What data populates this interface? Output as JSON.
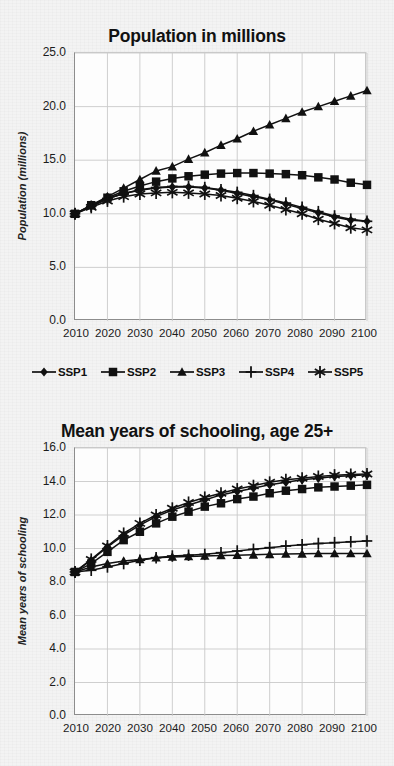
{
  "figure": {
    "background_color": "#f3f3f3",
    "series_color": "#111111",
    "grid_color": "#c9c9c9",
    "axis_color": "#8d8d8d"
  },
  "legend": {
    "position": "below-top-chart",
    "items": [
      {
        "label": "SSP1",
        "marker": "diamond-marker-icon"
      },
      {
        "label": "SSP2",
        "marker": "square-marker-icon"
      },
      {
        "label": "SSP3",
        "marker": "triangle-marker-icon"
      },
      {
        "label": "SSP4",
        "marker": "plus-marker-icon"
      },
      {
        "label": "SSP5",
        "marker": "asterisk-marker-icon"
      }
    ]
  },
  "chart_data": [
    {
      "id": "population",
      "type": "line",
      "title": "Population in millions",
      "xlabel": "",
      "ylabel": "Population (millions)",
      "x": [
        2010,
        2015,
        2020,
        2025,
        2030,
        2035,
        2040,
        2045,
        2050,
        2055,
        2060,
        2065,
        2070,
        2075,
        2080,
        2085,
        2090,
        2095,
        2100
      ],
      "xlim": [
        2010,
        2100
      ],
      "ylim": [
        0.0,
        25.0
      ],
      "yticks": [
        "0.0",
        "5.0",
        "10.0",
        "15.0",
        "20.0",
        "25.0"
      ],
      "ytick_values": [
        0.0,
        5.0,
        10.0,
        15.0,
        20.0,
        25.0
      ],
      "xticks": [
        "2010",
        "2020",
        "2030",
        "2040",
        "2050",
        "2060",
        "2070",
        "2080",
        "2090",
        "2100"
      ],
      "grid": true,
      "series": [
        {
          "name": "SSP1",
          "marker": "diamond-marker-icon",
          "values": [
            10.0,
            10.7,
            11.4,
            11.9,
            12.2,
            12.4,
            12.5,
            12.5,
            12.4,
            12.2,
            11.9,
            11.6,
            11.3,
            10.9,
            10.5,
            10.1,
            9.7,
            9.4,
            9.3
          ]
        },
        {
          "name": "SSP2",
          "marker": "square-marker-icon",
          "values": [
            10.0,
            10.8,
            11.5,
            12.1,
            12.6,
            13.0,
            13.3,
            13.5,
            13.65,
            13.75,
            13.8,
            13.8,
            13.75,
            13.7,
            13.6,
            13.4,
            13.2,
            12.9,
            12.7
          ]
        },
        {
          "name": "SSP3",
          "marker": "triangle-marker-icon",
          "values": [
            10.0,
            10.8,
            11.6,
            12.4,
            13.2,
            14.0,
            14.4,
            15.1,
            15.7,
            16.4,
            17.0,
            17.7,
            18.3,
            18.9,
            19.5,
            20.0,
            20.5,
            21.0,
            21.5
          ]
        },
        {
          "name": "SSP4",
          "marker": "plus-marker-icon",
          "values": [
            10.0,
            10.7,
            11.4,
            11.9,
            12.25,
            12.45,
            12.55,
            12.55,
            12.45,
            12.25,
            12.0,
            11.7,
            11.35,
            11.0,
            10.6,
            10.2,
            9.8,
            9.5,
            9.3
          ]
        },
        {
          "name": "SSP5",
          "marker": "asterisk-marker-icon",
          "values": [
            10.0,
            10.6,
            11.2,
            11.6,
            11.85,
            11.95,
            12.0,
            11.95,
            11.85,
            11.7,
            11.45,
            11.15,
            10.8,
            10.4,
            10.0,
            9.5,
            9.1,
            8.7,
            8.5
          ]
        }
      ]
    },
    {
      "id": "schooling",
      "type": "line",
      "title": "Mean years of schooling, age 25+",
      "xlabel": "",
      "ylabel": "Mean years of schooling",
      "x": [
        2010,
        2015,
        2020,
        2025,
        2030,
        2035,
        2040,
        2045,
        2050,
        2055,
        2060,
        2065,
        2070,
        2075,
        2080,
        2085,
        2090,
        2095,
        2100
      ],
      "xlim": [
        2010,
        2100
      ],
      "ylim": [
        0.0,
        16.0
      ],
      "yticks": [
        "0.0",
        "2.0",
        "4.0",
        "6.0",
        "8.0",
        "10.0",
        "12.0",
        "14.0",
        "16.0"
      ],
      "ytick_values": [
        0.0,
        2.0,
        4.0,
        6.0,
        8.0,
        10.0,
        12.0,
        14.0,
        16.0
      ],
      "xticks": [
        "2010",
        "2020",
        "2030",
        "2040",
        "2050",
        "2060",
        "2070",
        "2080",
        "2090",
        "2100"
      ],
      "grid": true,
      "series": [
        {
          "name": "SSP1",
          "marker": "diamond-marker-icon",
          "values": [
            8.6,
            9.3,
            10.1,
            10.8,
            11.4,
            11.9,
            12.3,
            12.6,
            12.9,
            13.2,
            13.4,
            13.6,
            13.8,
            13.95,
            14.1,
            14.2,
            14.3,
            14.35,
            14.4
          ]
        },
        {
          "name": "SSP2",
          "marker": "square-marker-icon",
          "values": [
            8.6,
            9.1,
            9.8,
            10.5,
            11.0,
            11.5,
            11.9,
            12.2,
            12.5,
            12.7,
            12.95,
            13.1,
            13.3,
            13.45,
            13.55,
            13.65,
            13.7,
            13.75,
            13.8
          ]
        },
        {
          "name": "SSP3",
          "marker": "triangle-marker-icon",
          "values": [
            8.6,
            8.9,
            9.1,
            9.25,
            9.35,
            9.45,
            9.5,
            9.52,
            9.55,
            9.58,
            9.6,
            9.62,
            9.65,
            9.67,
            9.68,
            9.7,
            9.7,
            9.7,
            9.7
          ]
        },
        {
          "name": "SSP4",
          "marker": "plus-marker-icon",
          "values": [
            8.6,
            8.7,
            8.9,
            9.1,
            9.3,
            9.45,
            9.55,
            9.6,
            9.65,
            9.75,
            9.85,
            9.95,
            10.05,
            10.15,
            10.22,
            10.3,
            10.35,
            10.4,
            10.45
          ]
        },
        {
          "name": "SSP5",
          "marker": "asterisk-marker-icon",
          "values": [
            8.6,
            9.35,
            10.15,
            10.9,
            11.5,
            12.0,
            12.4,
            12.75,
            13.05,
            13.3,
            13.55,
            13.75,
            13.95,
            14.1,
            14.2,
            14.3,
            14.38,
            14.42,
            14.45
          ]
        }
      ]
    }
  ]
}
